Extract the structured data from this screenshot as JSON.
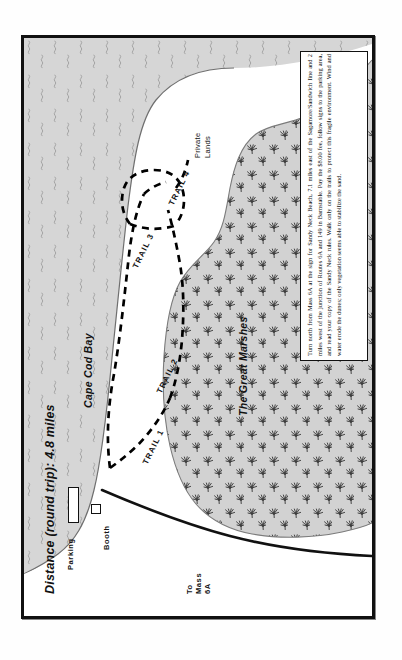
{
  "map": {
    "title": "Distance (round trip): 4.8 miles",
    "regions": {
      "bay": "Cape Cod Bay",
      "marshes": "The Great Marshes",
      "private_lands_line1": "Private",
      "private_lands_line2": "Lands"
    },
    "trails": [
      {
        "label": "TRAIL 1"
      },
      {
        "label": "TRAIL 2"
      },
      {
        "label": "TRAIL 3"
      },
      {
        "label": "TRAIL 4"
      }
    ],
    "facilities": {
      "parking": "Parking",
      "booth": "Booth"
    },
    "road": {
      "line1": "To",
      "line2": "Mass",
      "line3": "6A"
    },
    "info_text": "Turn north from Mass 6A at the sign for Sandy Neck Beach, 7.1 miles east of the Sagamore/Sandwich line and 2 miles west of the junction of Routes 6A and 149 in Barnstable. Pay the $8.00 fee, follow signs to the parking area, and read your copy of the Sandy Neck rules. Walk only on the trails to protect this fragile environment. Wind and water erode the dunes; only vegetation seems able to stabilize the sand.",
    "colors": {
      "marsh_fill": "#d2d2d2",
      "bay_fill": "#d6d6d6",
      "land_fill": "#ffffff",
      "ink": "#111111",
      "trail_dash": "#000000"
    },
    "icons": {
      "marsh_grass": "marsh-grass-tuft-icon",
      "water_ripple": "water-ripple-icon"
    }
  }
}
